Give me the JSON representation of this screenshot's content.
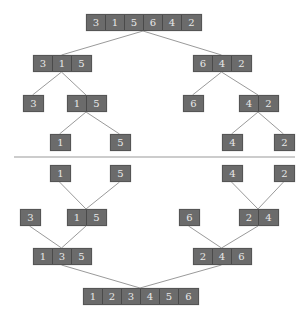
{
  "diagram": {
    "colors": {
      "box": "#6b6b6b",
      "text": "#e8e8e8",
      "edge": "#9a9a9a",
      "divider": "#bbbbbb"
    },
    "nodes": [
      {
        "id": "n0",
        "x": 86,
        "y": 14,
        "values": [
          "3",
          "1",
          "5",
          "6",
          "4",
          "2"
        ]
      },
      {
        "id": "n1",
        "x": 33,
        "y": 55,
        "values": [
          "3",
          "1",
          "5"
        ]
      },
      {
        "id": "n2",
        "x": 193,
        "y": 55,
        "values": [
          "6",
          "4",
          "2"
        ]
      },
      {
        "id": "n3",
        "x": 23,
        "y": 95,
        "values": [
          "3"
        ]
      },
      {
        "id": "n4",
        "x": 67,
        "y": 95,
        "values": [
          "1",
          "5"
        ]
      },
      {
        "id": "n5",
        "x": 183,
        "y": 95,
        "values": [
          "6"
        ]
      },
      {
        "id": "n6",
        "x": 239,
        "y": 95,
        "values": [
          "4",
          "2"
        ]
      },
      {
        "id": "n7",
        "x": 50,
        "y": 134,
        "values": [
          "1"
        ]
      },
      {
        "id": "n8",
        "x": 110,
        "y": 134,
        "values": [
          "5"
        ]
      },
      {
        "id": "n9",
        "x": 222,
        "y": 134,
        "values": [
          "4"
        ]
      },
      {
        "id": "n10",
        "x": 274,
        "y": 134,
        "values": [
          "2"
        ]
      },
      {
        "id": "m0",
        "x": 50,
        "y": 165,
        "values": [
          "1"
        ]
      },
      {
        "id": "m1",
        "x": 110,
        "y": 165,
        "values": [
          "5"
        ]
      },
      {
        "id": "m2",
        "x": 222,
        "y": 165,
        "values": [
          "4"
        ]
      },
      {
        "id": "m3",
        "x": 274,
        "y": 165,
        "values": [
          "2"
        ]
      },
      {
        "id": "m4",
        "x": 20,
        "y": 209,
        "values": [
          "3"
        ]
      },
      {
        "id": "m5",
        "x": 67,
        "y": 209,
        "values": [
          "1",
          "5"
        ]
      },
      {
        "id": "m6",
        "x": 179,
        "y": 209,
        "values": [
          "6"
        ]
      },
      {
        "id": "m7",
        "x": 239,
        "y": 209,
        "values": [
          "2",
          "4"
        ]
      },
      {
        "id": "m8",
        "x": 33,
        "y": 248,
        "values": [
          "1",
          "3",
          "5"
        ]
      },
      {
        "id": "m9",
        "x": 193,
        "y": 248,
        "values": [
          "2",
          "4",
          "6"
        ]
      },
      {
        "id": "m10",
        "x": 83,
        "y": 288,
        "values": [
          "1",
          "2",
          "3",
          "4",
          "5",
          "6"
        ]
      }
    ],
    "edges": [
      [
        "n0",
        "n1"
      ],
      [
        "n0",
        "n2"
      ],
      [
        "n1",
        "n3"
      ],
      [
        "n1",
        "n4"
      ],
      [
        "n2",
        "n5"
      ],
      [
        "n2",
        "n6"
      ],
      [
        "n4",
        "n7"
      ],
      [
        "n4",
        "n8"
      ],
      [
        "n6",
        "n9"
      ],
      [
        "n6",
        "n10"
      ],
      [
        "m0",
        "m5"
      ],
      [
        "m1",
        "m5"
      ],
      [
        "m2",
        "m7"
      ],
      [
        "m3",
        "m7"
      ],
      [
        "m4",
        "m8"
      ],
      [
        "m5",
        "m8"
      ],
      [
        "m6",
        "m9"
      ],
      [
        "m7",
        "m9"
      ],
      [
        "m8",
        "m10"
      ],
      [
        "m9",
        "m10"
      ]
    ],
    "divider_y": 157
  }
}
